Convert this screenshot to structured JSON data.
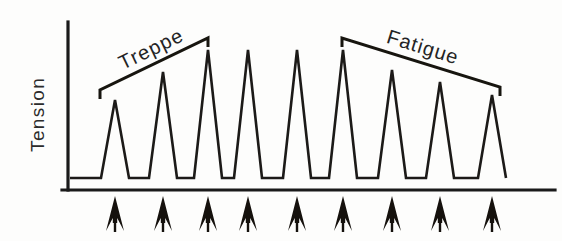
{
  "figure": {
    "background_color": "#fdfdfc",
    "ink_color": "#1a1a1a"
  },
  "axes": {
    "y_axis_label": "Tension",
    "x_axis_label": "",
    "y_axis_name": "tension-axis",
    "x_axis_name": "time-axis"
  },
  "annotations": {
    "treppe": {
      "label": "Treppe",
      "bracket_direction": "ascending"
    },
    "fatigue": {
      "label": "Fatigue",
      "bracket_direction": "descending"
    }
  },
  "stimuli": {
    "marker_icon": "up-arrow-icon",
    "count": 9,
    "description": "stimulus"
  },
  "chart_data": {
    "type": "line",
    "subtitle": "",
    "xlabel": "",
    "ylabel": "Tension",
    "grid": false,
    "legend_position": "none",
    "xlim": [
      0,
      10
    ],
    "ylim": [
      0,
      100
    ],
    "x_tick_labels": [],
    "y_tick_labels": [],
    "categories": [
      "twitch-1",
      "twitch-2",
      "twitch-3",
      "twitch-4",
      "twitch-5",
      "twitch-6",
      "twitch-7",
      "twitch-8",
      "twitch-9"
    ],
    "series": [
      {
        "name": "Tension",
        "values": [
          58,
          78,
          94,
          94,
          94,
          94,
          79,
          70,
          60
        ]
      }
    ],
    "peak_x": [
      115,
      163,
      208,
      248,
      297,
      343,
      392,
      440,
      492
    ],
    "peak_y": [
      100,
      72,
      50,
      50,
      50,
      50,
      70,
      82,
      95
    ],
    "baseline_y": 178,
    "trace_start_x": 70,
    "trace_end_x": 506,
    "peak_half_width": 14,
    "annotations_list": [
      {
        "text": "Treppe",
        "x1": 100,
        "y1": 90,
        "x2": 208,
        "y2": 38,
        "tick_length": 9
      },
      {
        "text": "Fatigue",
        "x1": 342,
        "y1": 38,
        "x2": 500,
        "y2": 87,
        "tick_length": 9
      }
    ],
    "stimulus_marks_x": [
      115,
      163,
      208,
      248,
      297,
      343,
      392,
      440,
      492
    ]
  }
}
